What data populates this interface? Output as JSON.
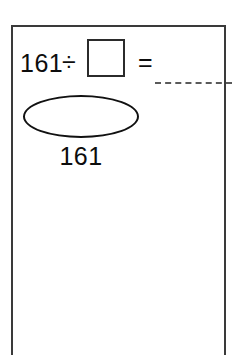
{
  "worksheet": {
    "frame_color": "#3a3a3a",
    "background_color": "#ffffff",
    "problem": {
      "dividend": "161",
      "divide_symbol": "÷",
      "equals_symbol": "=",
      "quotient_box_value": "",
      "answer_line_value": ""
    },
    "diagram": {
      "shape_label": "161",
      "shape_outline_color": "#111111",
      "shape_fill_color": "#ffffff"
    },
    "work_area": {
      "content": ""
    }
  }
}
